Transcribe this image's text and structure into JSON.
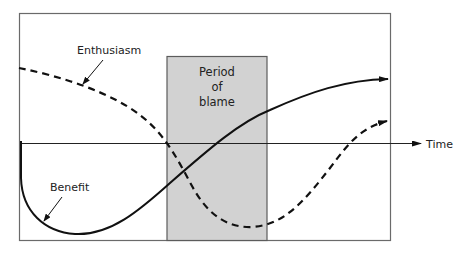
{
  "diagram": {
    "type": "conceptual curve diagram",
    "labels": {
      "enthusiasm": "Enthusiasm",
      "benefit": "Benefit",
      "time": "Time",
      "period_line1": "Period",
      "period_line2": "of",
      "period_line3": "blame"
    },
    "colors": {
      "frame": "#6a6a6a",
      "period_fill": "#d2d2d2",
      "period_stroke": "#5c5c5c",
      "curve": "#111111",
      "axis": "#222222",
      "background": "#ffffff"
    },
    "curves": [
      {
        "name": "Enthusiasm",
        "style": "dashed",
        "description": "Starts high, declines, drops sharply through the period of blame to a minimum, then recovers above baseline"
      },
      {
        "name": "Benefit",
        "style": "solid",
        "description": "Starts at baseline, dips to a deep minimum, then rises steadily through the period of blame to end high"
      }
    ],
    "axis": {
      "label": "Time",
      "direction": "right"
    },
    "shaded_region": {
      "label": "Period of blame"
    }
  }
}
